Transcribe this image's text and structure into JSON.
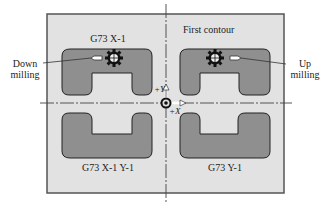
{
  "diagram": {
    "title_labels": {
      "top_left": "G73 X-1",
      "top_right": "First contour",
      "bottom_left": "G73 X-1 Y-1",
      "bottom_right": "G73 Y-1"
    },
    "annotations": {
      "left_line1": "Down",
      "left_line2": "milling",
      "right_line1": "Up",
      "right_line2": "milling"
    },
    "axes": {
      "y_label": "+Y",
      "x_label": "+X"
    },
    "colors": {
      "frame_fill": "#e2e2e2",
      "frame_stroke": "#555555",
      "shape_fill": "#8f8f8f",
      "shape_stroke": "#222222",
      "centerline": "#444444",
      "text": "#222222"
    }
  }
}
